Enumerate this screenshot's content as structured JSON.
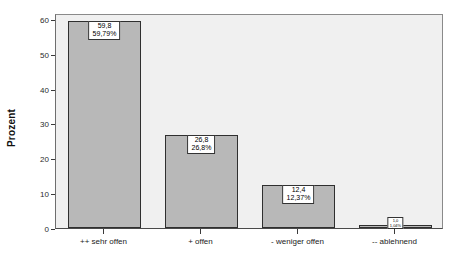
{
  "chart_data": {
    "type": "bar",
    "title": "",
    "subtitle": "",
    "xlabel": "",
    "ylabel": "Prozent",
    "categories": [
      "++ sehr offen",
      "+ offen",
      "- weniger offen",
      "-- ablehnend"
    ],
    "values": [
      59.8,
      26.8,
      12.4,
      1.0
    ],
    "value_labels": [
      "59,8",
      "26,8",
      "12,4",
      "1,0"
    ],
    "percent_labels": [
      "59,79%",
      "26,8%",
      "12,37%",
      "1,04%"
    ],
    "ylim": [
      0,
      62
    ],
    "yticks": [
      0,
      10,
      20,
      30,
      40,
      50,
      60
    ],
    "ytick_labels": [
      "0",
      "10",
      "20",
      "30",
      "40",
      "50",
      "60"
    ],
    "grid": false,
    "legend": "none",
    "bar_color": "#b8b8b8",
    "bar_border_color": "#2f2f2f",
    "plot_background": "#f0f0f0",
    "figure_background": "#ffffff",
    "label_box_background": "#ffffff",
    "label_box_border": "#333333"
  }
}
